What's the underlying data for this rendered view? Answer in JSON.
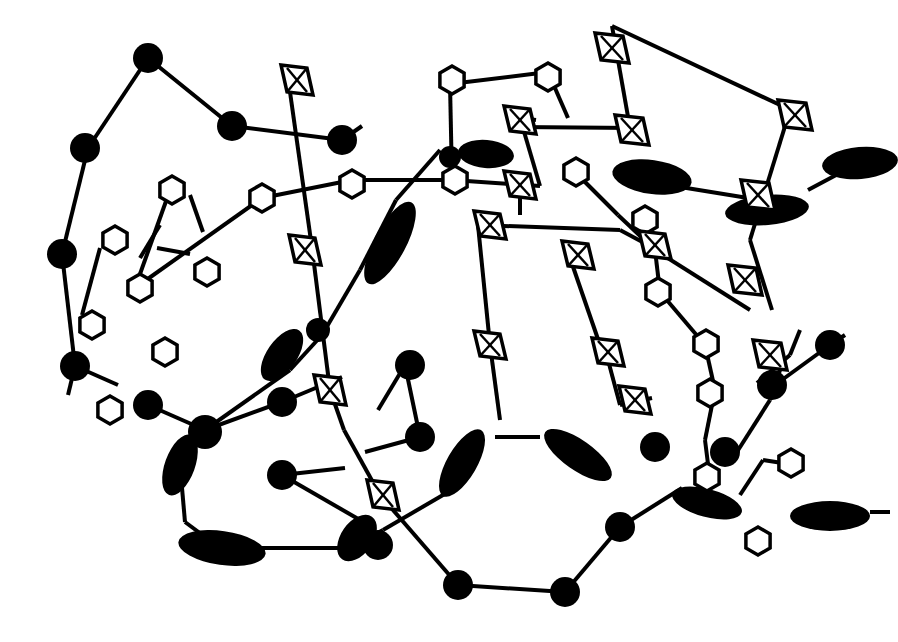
{
  "figure": {
    "title": "",
    "width": 898,
    "height": 642,
    "colors": {
      "ink": "#000000",
      "background": "#ffffff"
    }
  },
  "bonds": [
    [
      88,
      148,
      148,
      58
    ],
    [
      148,
      58,
      232,
      126
    ],
    [
      232,
      126,
      342,
      140
    ],
    [
      342,
      140,
      362,
      126
    ],
    [
      88,
      148,
      62,
      254
    ],
    [
      62,
      254,
      75,
      366
    ],
    [
      75,
      366,
      68,
      395
    ],
    [
      75,
      366,
      118,
      385
    ],
    [
      100,
      248,
      82,
      315
    ],
    [
      170,
      190,
      135,
      288
    ],
    [
      135,
      288,
      262,
      198
    ],
    [
      262,
      198,
      352,
      180
    ],
    [
      352,
      180,
      452,
      180
    ],
    [
      452,
      180,
      540,
      186
    ],
    [
      450,
      84,
      548,
      72
    ],
    [
      450,
      84,
      452,
      180
    ],
    [
      548,
      72,
      568,
      118
    ],
    [
      190,
      195,
      203,
      232
    ],
    [
      160,
      225,
      140,
      258
    ],
    [
      157,
      248,
      190,
      254
    ],
    [
      297,
      75,
      297,
      88
    ],
    [
      290,
      92,
      312,
      248
    ],
    [
      312,
      248,
      330,
      390
    ],
    [
      330,
      390,
      344,
      430
    ],
    [
      344,
      430,
      380,
      495
    ],
    [
      440,
      150,
      396,
      200
    ],
    [
      396,
      200,
      360,
      270
    ],
    [
      360,
      270,
      322,
      335
    ],
    [
      322,
      335,
      290,
      370
    ],
    [
      290,
      370,
      205,
      430
    ],
    [
      205,
      430,
      148,
      405
    ],
    [
      205,
      430,
      282,
      402
    ],
    [
      282,
      402,
      342,
      377
    ],
    [
      205,
      430,
      180,
      465
    ],
    [
      180,
      465,
      185,
      522
    ],
    [
      185,
      522,
      220,
      548
    ],
    [
      258,
      548,
      350,
      548
    ],
    [
      350,
      548,
      383,
      530
    ],
    [
      282,
      475,
      360,
      520
    ],
    [
      282,
      475,
      345,
      468
    ],
    [
      405,
      365,
      420,
      437
    ],
    [
      378,
      410,
      405,
      365
    ],
    [
      420,
      437,
      365,
      452
    ],
    [
      380,
      495,
      458,
      585
    ],
    [
      458,
      585,
      565,
      592
    ],
    [
      565,
      592,
      620,
      527
    ],
    [
      620,
      527,
      682,
      488
    ],
    [
      383,
      530,
      455,
      488
    ],
    [
      495,
      437,
      540,
      437
    ],
    [
      520,
      118,
      536,
      120
    ],
    [
      540,
      186,
      520,
      118
    ],
    [
      520,
      185,
      520,
      215
    ],
    [
      518,
      127,
      635,
      128
    ],
    [
      478,
      225,
      620,
      230
    ],
    [
      620,
      230,
      648,
      245
    ],
    [
      478,
      225,
      490,
      345
    ],
    [
      490,
      345,
      500,
      420
    ],
    [
      570,
      258,
      600,
      345
    ],
    [
      600,
      345,
      608,
      360
    ],
    [
      608,
      360,
      620,
      405
    ],
    [
      620,
      405,
      652,
      398
    ],
    [
      575,
      172,
      618,
      215
    ],
    [
      618,
      215,
      655,
      250
    ],
    [
      655,
      250,
      750,
      310
    ],
    [
      655,
      250,
      660,
      292
    ],
    [
      660,
      292,
      705,
      345
    ],
    [
      705,
      345,
      715,
      390
    ],
    [
      715,
      390,
      705,
      440
    ],
    [
      705,
      440,
      710,
      480
    ],
    [
      668,
      185,
      748,
      198
    ],
    [
      748,
      198,
      790,
      208
    ],
    [
      790,
      110,
      750,
      240
    ],
    [
      750,
      240,
      772,
      310
    ],
    [
      612,
      26,
      795,
      112
    ],
    [
      612,
      26,
      630,
      128
    ],
    [
      808,
      190,
      868,
      158
    ],
    [
      775,
      385,
      830,
      345
    ],
    [
      830,
      345,
      845,
      335
    ],
    [
      757,
      383,
      790,
      355
    ],
    [
      790,
      355,
      800,
      330
    ],
    [
      735,
      455,
      770,
      400
    ],
    [
      770,
      400,
      780,
      370
    ],
    [
      740,
      495,
      763,
      460
    ],
    [
      763,
      460,
      795,
      465
    ],
    [
      870,
      512,
      890,
      512
    ]
  ],
  "atoms": [
    {
      "x": 148,
      "y": 58,
      "r": 15
    },
    {
      "x": 232,
      "y": 126,
      "r": 15
    },
    {
      "x": 342,
      "y": 140,
      "r": 15
    },
    {
      "x": 85,
      "y": 148,
      "r": 15
    },
    {
      "x": 62,
      "y": 254,
      "r": 15
    },
    {
      "x": 75,
      "y": 366,
      "r": 15
    },
    {
      "x": 148,
      "y": 405,
      "r": 15
    },
    {
      "x": 205,
      "y": 432,
      "r": 17
    },
    {
      "x": 282,
      "y": 402,
      "r": 15
    },
    {
      "x": 282,
      "y": 475,
      "r": 15
    },
    {
      "x": 410,
      "y": 365,
      "r": 15
    },
    {
      "x": 420,
      "y": 437,
      "r": 15
    },
    {
      "x": 378,
      "y": 545,
      "r": 15
    },
    {
      "x": 458,
      "y": 585,
      "r": 15
    },
    {
      "x": 565,
      "y": 592,
      "r": 15
    },
    {
      "x": 620,
      "y": 527,
      "r": 15
    },
    {
      "x": 655,
      "y": 447,
      "r": 15
    },
    {
      "x": 725,
      "y": 452,
      "r": 15
    },
    {
      "x": 772,
      "y": 385,
      "r": 15
    },
    {
      "x": 830,
      "y": 345,
      "r": 15
    },
    {
      "x": 318,
      "y": 330,
      "r": 12
    },
    {
      "x": 450,
      "y": 157,
      "r": 11
    }
  ],
  "rods": [
    {
      "x": 390,
      "y": 243,
      "rx": 46,
      "ry": 16,
      "angle": -62
    },
    {
      "x": 282,
      "y": 355,
      "rx": 30,
      "ry": 15,
      "angle": -55
    },
    {
      "x": 180,
      "y": 465,
      "rx": 32,
      "ry": 15,
      "angle": -70
    },
    {
      "x": 222,
      "y": 548,
      "rx": 44,
      "ry": 17,
      "angle": 8
    },
    {
      "x": 357,
      "y": 538,
      "rx": 26,
      "ry": 16,
      "angle": -55
    },
    {
      "x": 462,
      "y": 463,
      "rx": 38,
      "ry": 15,
      "angle": -60
    },
    {
      "x": 578,
      "y": 455,
      "rx": 40,
      "ry": 15,
      "angle": 35
    },
    {
      "x": 707,
      "y": 503,
      "rx": 36,
      "ry": 14,
      "angle": 15
    },
    {
      "x": 830,
      "y": 516,
      "rx": 40,
      "ry": 15,
      "angle": 0
    },
    {
      "x": 486,
      "y": 154,
      "rx": 28,
      "ry": 14,
      "angle": 5
    },
    {
      "x": 652,
      "y": 177,
      "rx": 40,
      "ry": 17,
      "angle": 8
    },
    {
      "x": 767,
      "y": 210,
      "rx": 42,
      "ry": 15,
      "angle": -5
    },
    {
      "x": 860,
      "y": 163,
      "rx": 38,
      "ry": 16,
      "angle": -5
    }
  ],
  "hexagons": [
    {
      "x": 452,
      "y": 80,
      "r": 14
    },
    {
      "x": 548,
      "y": 77,
      "r": 14
    },
    {
      "x": 455,
      "y": 180,
      "r": 14
    },
    {
      "x": 352,
      "y": 184,
      "r": 14
    },
    {
      "x": 262,
      "y": 198,
      "r": 14
    },
    {
      "x": 172,
      "y": 190,
      "r": 14
    },
    {
      "x": 115,
      "y": 240,
      "r": 14
    },
    {
      "x": 207,
      "y": 272,
      "r": 14
    },
    {
      "x": 140,
      "y": 288,
      "r": 14
    },
    {
      "x": 92,
      "y": 325,
      "r": 14
    },
    {
      "x": 165,
      "y": 352,
      "r": 14
    },
    {
      "x": 110,
      "y": 410,
      "r": 14
    },
    {
      "x": 576,
      "y": 172,
      "r": 14
    },
    {
      "x": 645,
      "y": 220,
      "r": 14
    },
    {
      "x": 658,
      "y": 292,
      "r": 14
    },
    {
      "x": 706,
      "y": 344,
      "r": 14
    },
    {
      "x": 710,
      "y": 393,
      "r": 14
    },
    {
      "x": 707,
      "y": 477,
      "r": 14
    },
    {
      "x": 791,
      "y": 463,
      "r": 14
    },
    {
      "x": 758,
      "y": 541,
      "r": 14
    }
  ],
  "diamonds": [
    {
      "x": 297,
      "y": 80,
      "w": 32,
      "h": 30
    },
    {
      "x": 305,
      "y": 250,
      "w": 32,
      "h": 30
    },
    {
      "x": 330,
      "y": 390,
      "w": 32,
      "h": 30
    },
    {
      "x": 383,
      "y": 495,
      "w": 32,
      "h": 30
    },
    {
      "x": 612,
      "y": 48,
      "w": 34,
      "h": 30
    },
    {
      "x": 632,
      "y": 130,
      "w": 34,
      "h": 30
    },
    {
      "x": 520,
      "y": 120,
      "w": 32,
      "h": 28
    },
    {
      "x": 520,
      "y": 185,
      "w": 32,
      "h": 28
    },
    {
      "x": 490,
      "y": 225,
      "w": 32,
      "h": 28
    },
    {
      "x": 578,
      "y": 255,
      "w": 32,
      "h": 28
    },
    {
      "x": 655,
      "y": 245,
      "w": 32,
      "h": 28
    },
    {
      "x": 490,
      "y": 345,
      "w": 32,
      "h": 28
    },
    {
      "x": 608,
      "y": 352,
      "w": 32,
      "h": 28
    },
    {
      "x": 635,
      "y": 400,
      "w": 32,
      "h": 28
    },
    {
      "x": 795,
      "y": 115,
      "w": 34,
      "h": 30
    },
    {
      "x": 758,
      "y": 195,
      "w": 34,
      "h": 30
    },
    {
      "x": 745,
      "y": 280,
      "w": 34,
      "h": 30
    },
    {
      "x": 770,
      "y": 355,
      "w": 34,
      "h": 30
    }
  ]
}
